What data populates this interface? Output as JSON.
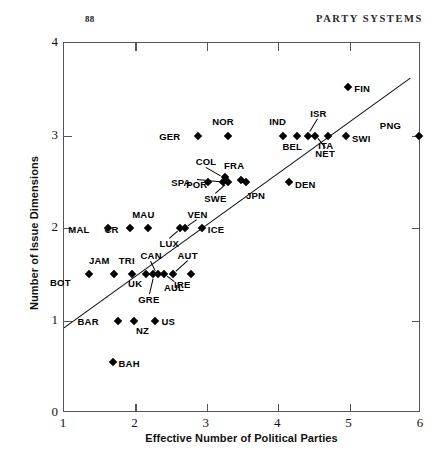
{
  "header": {
    "folio": "88",
    "running_head": "PARTY SYSTEMS"
  },
  "chart_data": {
    "type": "scatter",
    "title": "",
    "xlabel": "Effective Number of Political Parties",
    "ylabel": "Number of Issue Dimensions",
    "xlim": [
      1,
      6
    ],
    "ylim": [
      0,
      4
    ],
    "xticks": [
      "1",
      "2",
      "3",
      "4",
      "5",
      "6"
    ],
    "yticks": [
      "0",
      "1",
      "2",
      "3",
      "4"
    ],
    "grid": false,
    "legend": "none",
    "trendline": {
      "visible": true,
      "x": [
        1.0,
        5.85
      ],
      "y": [
        0.92,
        3.62
      ]
    },
    "points": [
      {
        "label": "BOT",
        "x": 1.35,
        "y": 1.5,
        "lx": -26,
        "ly": 8
      },
      {
        "label": "JAM",
        "x": 1.7,
        "y": 1.5,
        "lx": -12,
        "ly": -14
      },
      {
        "label": "TRI",
        "x": 1.95,
        "y": 1.5,
        "lx": -5,
        "ly": -14
      },
      {
        "label": "UK",
        "x": 2.15,
        "y": 1.5,
        "lx": -12,
        "ly": 9
      },
      {
        "label": "GRE",
        "x": 2.25,
        "y": 1.5,
        "lx": -2,
        "ly": 25,
        "leader": true
      },
      {
        "label": "CAN",
        "x": 2.31,
        "y": 1.5,
        "lx": -4,
        "ly": -19,
        "leader": true
      },
      {
        "label": "AUL",
        "x": 2.4,
        "y": 1.5,
        "lx": 0,
        "ly": 13,
        "leader": true
      },
      {
        "label": "AUT",
        "x": 2.52,
        "y": 1.5,
        "lx": 5,
        "ly": -19,
        "leader": true
      },
      {
        "label": "IRE",
        "x": 2.78,
        "y": 1.5,
        "lx": -9,
        "ly": 10
      },
      {
        "label": "BAR",
        "x": 1.75,
        "y": 1.0,
        "lx": -27,
        "ly": 1
      },
      {
        "label": "NZ",
        "x": 1.98,
        "y": 1.0,
        "lx": 2,
        "ly": 10
      },
      {
        "label": "US",
        "x": 2.28,
        "y": 1.0,
        "lx": 6,
        "ly": 1
      },
      {
        "label": "BAH",
        "x": 1.68,
        "y": 0.55,
        "lx": 6,
        "ly": 1
      },
      {
        "label": "MAL",
        "x": 1.62,
        "y": 2.0,
        "lx": -27,
        "ly": 1
      },
      {
        "label": "CR",
        "x": 1.93,
        "y": 2.0,
        "lx": -20,
        "ly": 1
      },
      {
        "label": "MAU",
        "x": 2.18,
        "y": 2.0,
        "lx": -2,
        "ly": -14
      },
      {
        "label": "LUX",
        "x": 2.63,
        "y": 2.0,
        "lx": -9,
        "ly": 15,
        "leader": true
      },
      {
        "label": "VEN",
        "x": 2.7,
        "y": 2.0,
        "lx": 2,
        "ly": -14,
        "leader": true
      },
      {
        "label": "ICE",
        "x": 2.93,
        "y": 2.0,
        "lx": 6,
        "ly": 1
      },
      {
        "label": "SPA",
        "x": 3.02,
        "y": 2.5,
        "lx": -26,
        "ly": 1
      },
      {
        "label": "POR",
        "x": 3.23,
        "y": 2.5,
        "lx": -24,
        "ly": 3,
        "leader": true
      },
      {
        "label": "COL",
        "x": 3.25,
        "y": 2.55,
        "lx": -16,
        "ly": -16,
        "leader": true
      },
      {
        "label": "SWE",
        "x": 3.3,
        "y": 2.5,
        "lx": -10,
        "ly": 17,
        "leader": true
      },
      {
        "label": "FRA",
        "x": 3.48,
        "y": 2.52,
        "lx": -5,
        "ly": -14
      },
      {
        "label": "JPN",
        "x": 3.55,
        "y": 2.5,
        "lx": 0,
        "ly": 14
      },
      {
        "label": "DEN",
        "x": 4.15,
        "y": 2.5,
        "lx": 6,
        "ly": 3
      },
      {
        "label": "GER",
        "x": 2.88,
        "y": 3.0,
        "lx": -26,
        "ly": 1
      },
      {
        "label": "NOR",
        "x": 3.3,
        "y": 3.0,
        "lx": -2,
        "ly": -14
      },
      {
        "label": "IND",
        "x": 4.07,
        "y": 3.0,
        "lx": -5,
        "ly": -14
      },
      {
        "label": "BEL",
        "x": 4.27,
        "y": 3.0,
        "lx": -3,
        "ly": 11
      },
      {
        "label": "ISR",
        "x": 4.42,
        "y": 3.0,
        "lx": 2,
        "ly": -22,
        "leader": true
      },
      {
        "label": "NET",
        "x": 4.52,
        "y": 3.0,
        "lx": 0,
        "ly": 18,
        "leader": true
      },
      {
        "label": "ITA",
        "x": 4.7,
        "y": 3.0,
        "lx": -3,
        "ly": 10
      },
      {
        "label": "SWI",
        "x": 4.95,
        "y": 3.0,
        "lx": 6,
        "ly": 3
      },
      {
        "label": "PNG",
        "x": 5.97,
        "y": 3.0,
        "lx": -26,
        "ly": -10
      },
      {
        "label": "FIN",
        "x": 4.98,
        "y": 3.52,
        "lx": 6,
        "ly": 1
      }
    ]
  }
}
